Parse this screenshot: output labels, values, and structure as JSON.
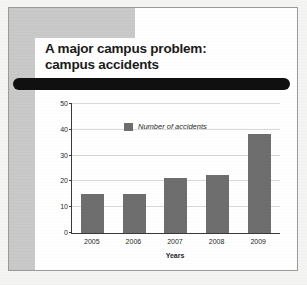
{
  "slide": {
    "title_line1": "A major campus problem:",
    "title_line2": "campus accidents",
    "redaction_name": "redacted-text-bar"
  },
  "colors": {
    "bar": "#6e6e6e",
    "band": "#c9c9c9",
    "axis": "#3a3a3a",
    "gridline": "#d9d9d9",
    "redaction": "#101010",
    "card_border": "#9a9a9a"
  },
  "chart_data": {
    "type": "bar",
    "title": "",
    "xlabel": "Years",
    "ylabel": "",
    "categories": [
      "2005",
      "2006",
      "2007",
      "2008",
      "2009"
    ],
    "values": [
      15,
      15,
      21.5,
      22.5,
      38.5
    ],
    "series": [
      {
        "name": "Number of accidents",
        "values": [
          15,
          15,
          21.5,
          22.5,
          38.5
        ]
      }
    ],
    "ylim": [
      0,
      50
    ],
    "yticks": [
      "0",
      "10",
      "20",
      "30",
      "40",
      "50"
    ],
    "grid": true,
    "legend": [
      "Number of accidents"
    ],
    "legend_position": "inside-top-left"
  }
}
